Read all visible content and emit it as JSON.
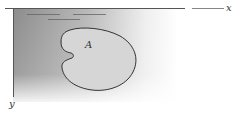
{
  "diagram": {
    "type": "region-in-half-plane",
    "axes": {
      "x_label": "x",
      "y_label": "y"
    },
    "region": {
      "label": "A",
      "fill": "#d6d6d6",
      "stroke": "#333333"
    },
    "shading": {
      "dark": "#8a8a8a",
      "light": "#ffffff"
    },
    "surface_marks": 3
  }
}
